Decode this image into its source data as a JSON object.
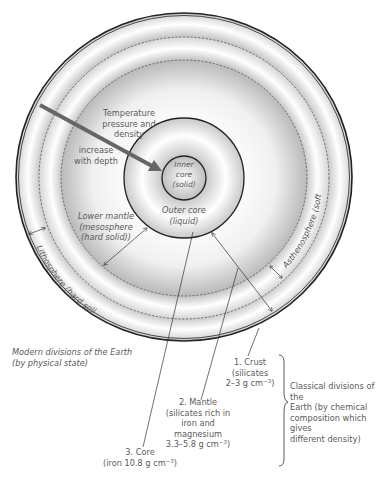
{
  "layers": {
    "inner_core": {
      "line1": "Inner",
      "line2": "core",
      "line3": "(solid)"
    },
    "outer_core": {
      "line1": "Outer core",
      "line2": "(liquid)"
    },
    "lower_mantle": {
      "line1": "Lower mantle",
      "line2": "(mesosphere",
      "line3": "(hard solid))"
    },
    "asthenosphere": {
      "label": "Asthenosphere (soft solid)"
    },
    "lithosphere": {
      "label": "Lithosphere (hard solid)"
    }
  },
  "arrow_note": {
    "line1": "Temperature",
    "line2": "pressure and",
    "line3": "density",
    "line4": "increase",
    "line5": "with depth"
  },
  "modern_divisions": {
    "line1": "Modern divisions of the Earth",
    "line2": "(by physical state)"
  },
  "classical_layers": {
    "crust": {
      "line1": "1. Crust",
      "line2": "(silicates",
      "line3": "2–3 g cm",
      "exp": "−3",
      "close": ")"
    },
    "mantle": {
      "line1": "2. Mantle",
      "line2": "(silicates rich in",
      "line3": "iron and magnesium",
      "line4": "3.3–5.8  g cm",
      "exp": "−3",
      "close": ")"
    },
    "core": {
      "line1": "3. Core",
      "line2": "(iron 10.8 g cm",
      "exp": "−3",
      "close": ")"
    }
  },
  "classical_divisions": {
    "line1": "Classical divisions of the",
    "line2": "Earth (by chemical",
    "line3": "composition which gives",
    "line4": "different density)"
  },
  "colors": {
    "line": "#222222",
    "arrow": "#666666",
    "text": "#555555",
    "shade_dark": "#bdbdbd",
    "shade_light": "#ffffff"
  }
}
